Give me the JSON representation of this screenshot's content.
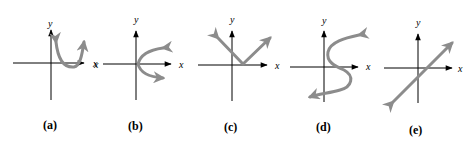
{
  "figure": {
    "panels": [
      {
        "id": "a",
        "caption": "(a)",
        "y_label": "y",
        "x_label": "x",
        "curve": "u-shaped parabola opening upward, right of y-axis"
      },
      {
        "id": "b",
        "caption": "(b)",
        "y_label": "y",
        "x_label": "x",
        "x_label_left": "x",
        "curve": "parabola opening to the right with vertex at origin"
      },
      {
        "id": "c",
        "caption": "(c)",
        "y_label": "y",
        "x_label": "x",
        "curve": "v-shaped absolute value graph with vertex on positive x-axis"
      },
      {
        "id": "d",
        "caption": "(d)",
        "y_label": "y",
        "x_label": "x",
        "curve": "s-shaped curve crossing the x-axis, fails vertical line test"
      },
      {
        "id": "e",
        "caption": "(e)",
        "y_label": "y",
        "x_label": "x",
        "x_label_left": "x",
        "curve": "straight line with positive slope"
      }
    ]
  },
  "colors": {
    "axis": "#000000",
    "curve": "#8c8c8c"
  }
}
